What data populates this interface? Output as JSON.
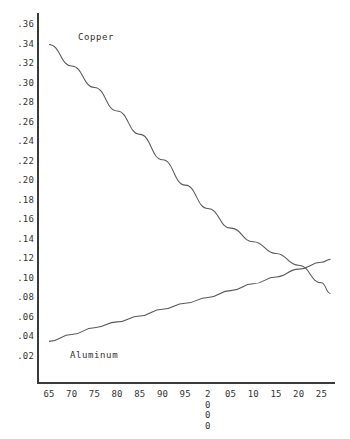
{
  "chart_data": {
    "type": "line",
    "title": "",
    "subtitle": "",
    "xlabel": "",
    "ylabel": "",
    "xlim": [
      1965,
      2028
    ],
    "ylim": [
      0.0,
      0.37
    ],
    "grid": false,
    "legend_position": "inline-annotation",
    "x_tick_labels": [
      "65",
      "70",
      "75",
      "80",
      "85",
      "90",
      "95",
      "2000",
      "05",
      "10",
      "15",
      "20",
      "25"
    ],
    "x_tick_values": [
      1965,
      1970,
      1975,
      1980,
      1985,
      1990,
      1995,
      2000,
      2005,
      2010,
      2015,
      2020,
      2025
    ],
    "y_tick_labels": [
      ".02",
      ".04",
      ".06",
      ".08",
      ".10",
      ".12",
      ".14",
      ".16",
      ".18",
      ".20",
      ".22",
      ".24",
      ".26",
      ".28",
      ".30",
      ".32",
      ".34",
      ".36"
    ],
    "y_tick_values": [
      0.02,
      0.04,
      0.06,
      0.08,
      0.1,
      0.12,
      0.14,
      0.16,
      0.18,
      0.2,
      0.22,
      0.24,
      0.26,
      0.28,
      0.3,
      0.32,
      0.34,
      0.36
    ],
    "x": [
      1965,
      1970,
      1975,
      1980,
      1985,
      1990,
      1995,
      2000,
      2005,
      2010,
      2015,
      2020,
      2025,
      2027
    ],
    "series": [
      {
        "name": "Copper",
        "color": "#585858",
        "annotation": "Copper",
        "values": [
          0.34,
          0.318,
          0.296,
          0.272,
          0.248,
          0.222,
          0.196,
          0.172,
          0.152,
          0.138,
          0.126,
          0.114,
          0.096,
          0.085
        ]
      },
      {
        "name": "Aluminum",
        "color": "#585858",
        "annotation": "Aluminum",
        "values": [
          0.036,
          0.043,
          0.05,
          0.056,
          0.062,
          0.069,
          0.075,
          0.081,
          0.088,
          0.095,
          0.102,
          0.11,
          0.117,
          0.12
        ]
      }
    ]
  },
  "annotations": {
    "copper_label": "Copper",
    "aluminum_label": "Aluminum"
  },
  "colors": {
    "background": "#ffffff",
    "axis": "#3a3a3a",
    "line": "#585858",
    "text": "#333333"
  }
}
